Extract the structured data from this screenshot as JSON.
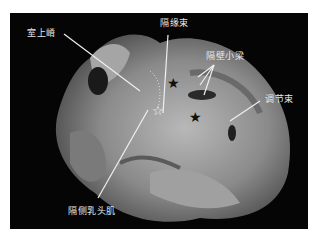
{
  "figure": {
    "labels": {
      "crista_supraventricularis": "室上嵴",
      "septomarginal_band": "隔缘束",
      "septal_trabeculae": "隔壁小梁",
      "moderator_band": "调节束",
      "septal_papillary_muscle": "隔侧乳头肌"
    },
    "markers": {
      "black_star_count": 2,
      "white_star_count": 1
    },
    "colors": {
      "background": "#050505",
      "tissue": "#9a9a9a",
      "label_text": "#e8e8e8",
      "leader_line": "#f0f0f0"
    }
  }
}
